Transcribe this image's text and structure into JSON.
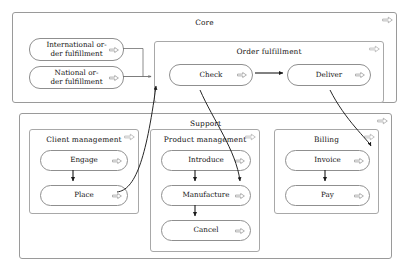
{
  "diagram": {
    "canvas": {
      "width": 409,
      "height": 274
    },
    "colors": {
      "background": "#ffffff",
      "pool_border": "#9a9a9a",
      "group_border": "#a8a8a8",
      "activity_border": "#8f8f8f",
      "connector": "#1a1a1a",
      "text": "#111111"
    }
  },
  "pools": [
    {
      "id": "core",
      "label": "Core",
      "marker_icon": "process-arrow-icon"
    },
    {
      "id": "support",
      "label": "Support",
      "marker_icon": "process-arrow-icon"
    }
  ],
  "groups": [
    {
      "id": "order-fulfillment",
      "label": "Order fulfillment",
      "pool": "core",
      "marker_icon": "process-arrow-icon"
    },
    {
      "id": "client-management",
      "label": "Client management",
      "pool": "support",
      "marker_icon": "process-arrow-icon"
    },
    {
      "id": "product-management",
      "label": "Product management",
      "pool": "support",
      "marker_icon": "process-arrow-icon"
    },
    {
      "id": "billing",
      "label": "Billing",
      "pool": "support",
      "marker_icon": "process-arrow-icon"
    }
  ],
  "activities": [
    {
      "id": "international-order-fulfillment",
      "label": "International or-\nder fulfillment",
      "group": "core",
      "marker_icon": "process-arrow-icon"
    },
    {
      "id": "national-order-fulfillment",
      "label": "National or-\nder fulfillment",
      "group": "core",
      "marker_icon": "process-arrow-icon"
    },
    {
      "id": "check",
      "label": "Check",
      "group": "order-fulfillment",
      "marker_icon": "process-arrow-icon"
    },
    {
      "id": "deliver",
      "label": "Deliver",
      "group": "order-fulfillment",
      "marker_icon": "process-arrow-icon"
    },
    {
      "id": "engage",
      "label": "Engage",
      "group": "client-management",
      "marker_icon": "process-arrow-icon"
    },
    {
      "id": "place",
      "label": "Place",
      "group": "client-management",
      "marker_icon": "process-arrow-icon"
    },
    {
      "id": "introduce",
      "label": "Introduce",
      "group": "product-management",
      "marker_icon": "process-arrow-icon"
    },
    {
      "id": "manufacture",
      "label": "Manufacture",
      "group": "product-management",
      "marker_icon": "process-arrow-icon"
    },
    {
      "id": "cancel",
      "label": "Cancel",
      "group": "product-management",
      "marker_icon": "process-arrow-icon"
    },
    {
      "id": "invoice",
      "label": "Invoice",
      "group": "billing",
      "marker_icon": "process-arrow-icon"
    },
    {
      "id": "pay",
      "label": "Pay",
      "group": "billing",
      "marker_icon": "process-arrow-icon"
    }
  ],
  "connectors": [
    {
      "id": "intl-to-junction",
      "from": "international-order-fulfillment",
      "to": "order-fulfillment",
      "style": "orthogonal"
    },
    {
      "id": "national-to-junction",
      "from": "national-order-fulfillment",
      "to": "order-fulfillment",
      "style": "orthogonal"
    },
    {
      "id": "check-to-deliver",
      "from": "check",
      "to": "deliver",
      "style": "straight"
    },
    {
      "id": "place-to-check",
      "from": "place",
      "to": "check",
      "style": "curved"
    },
    {
      "id": "check-to-manufacture",
      "from": "check",
      "to": "manufacture",
      "style": "curved"
    },
    {
      "id": "deliver-to-invoice",
      "from": "deliver",
      "to": "invoice",
      "style": "curved"
    },
    {
      "id": "engage-to-place",
      "from": "engage",
      "to": "place",
      "style": "straight"
    },
    {
      "id": "introduce-to-manufacture",
      "from": "introduce",
      "to": "manufacture",
      "style": "straight"
    },
    {
      "id": "manufacture-to-cancel",
      "from": "manufacture",
      "to": "cancel",
      "style": "straight"
    },
    {
      "id": "invoice-to-pay",
      "from": "invoice",
      "to": "pay",
      "style": "straight"
    }
  ]
}
